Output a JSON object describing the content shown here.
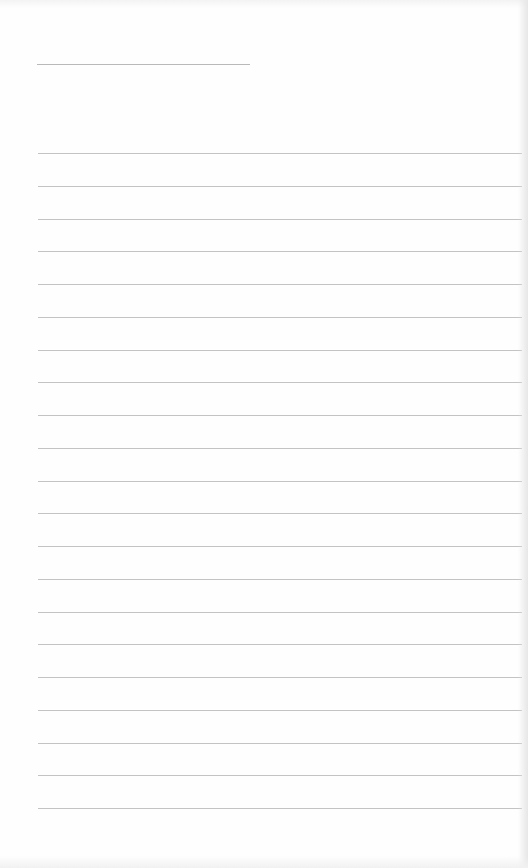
{
  "page": {
    "type": "lined-notepaper",
    "background_color": "#fefefe",
    "rule_color": "#c3c3c3",
    "title_line": {
      "left": 37,
      "top": 64,
      "width": 213
    },
    "rules": {
      "count": 21,
      "left": 38,
      "width": 484,
      "first_top": 153,
      "spacing": 32.75
    },
    "text": ""
  }
}
